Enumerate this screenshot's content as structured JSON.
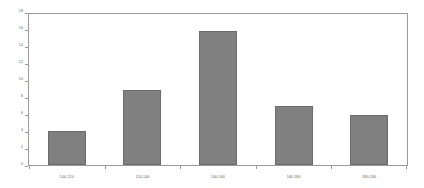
{
  "chart_data": {
    "type": "bar",
    "title": "",
    "subtitle": "",
    "xlabel": "",
    "ylabel": "",
    "categories": [
      "100-120",
      "120-140",
      "140-160",
      "160-180",
      "180-200"
    ],
    "values": [
      4,
      9,
      16,
      7,
      6
    ],
    "series": [
      {
        "name": "Frequency",
        "values": [
          4,
          9,
          16,
          7,
          6
        ]
      }
    ],
    "ylim": [
      0,
      18
    ],
    "ytick_step": 2,
    "yticks": [
      0,
      2,
      4,
      6,
      8,
      10,
      12,
      14,
      16,
      18
    ],
    "ytick_labels": [
      "0",
      "2",
      "4",
      "6",
      "8",
      "10",
      "12",
      "14",
      "16",
      "18"
    ],
    "grid": false,
    "legend": false,
    "legend_position": "none",
    "annotations": [],
    "colors": {
      "bar_fill": "#808080",
      "bar_border": "#6b6b6b",
      "frame": "#9a9a9a",
      "tick_label": "#595959",
      "background": "#ffffff"
    }
  }
}
